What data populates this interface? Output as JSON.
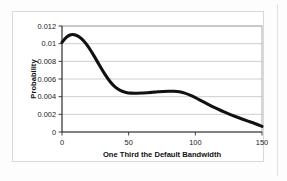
{
  "chart_data": {
    "type": "line",
    "title": "",
    "subtitle": "",
    "xlabel": "One Third the Default Bandwidth",
    "ylabel": "Probability",
    "xlim": [
      0,
      150
    ],
    "ylim": [
      0,
      0.012
    ],
    "grid": true,
    "grid_axis": "y",
    "legend": false,
    "legend_position": "none",
    "x_ticks": [
      0,
      50,
      100,
      150
    ],
    "x_tick_labels": [
      "0",
      "50",
      "100",
      "150"
    ],
    "y_ticks": [
      0,
      0.002,
      0.004,
      0.006,
      0.008,
      0.01,
      0.012
    ],
    "y_tick_labels": [
      "0",
      "0.002",
      "0.004",
      "0.006",
      "0.008",
      "0.01",
      "0.012"
    ],
    "series": [
      {
        "name": "Probability density",
        "color": "#111111",
        "line_width": 3,
        "x": [
          0,
          3,
          6,
          8,
          10,
          13,
          16,
          20,
          24,
          28,
          32,
          36,
          40,
          44,
          48,
          52,
          56,
          60,
          64,
          68,
          72,
          76,
          80,
          84,
          88,
          92,
          96,
          100,
          105,
          110,
          115,
          120,
          125,
          130,
          135,
          140,
          145,
          150
        ],
        "y": [
          0.01015,
          0.01068,
          0.01098,
          0.01103,
          0.01098,
          0.01075,
          0.01035,
          0.00958,
          0.00862,
          0.00758,
          0.00658,
          0.00572,
          0.00508,
          0.00468,
          0.00448,
          0.0044,
          0.00439,
          0.00441,
          0.00445,
          0.0045,
          0.00455,
          0.00459,
          0.00461,
          0.00461,
          0.00455,
          0.0044,
          0.00418,
          0.0039,
          0.0035,
          0.0031,
          0.00272,
          0.00238,
          0.00205,
          0.00175,
          0.00147,
          0.0012,
          0.00094,
          0.00064
        ]
      }
    ],
    "annotations": []
  },
  "axes": {
    "y_title": "Probability",
    "x_title": "One Third the Default Bandwidth"
  }
}
